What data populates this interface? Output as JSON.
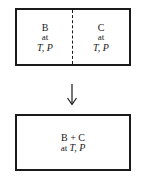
{
  "diagram": {
    "top_box": {
      "left_compartment": {
        "species": "B",
        "at": "at",
        "conditions": "T, P"
      },
      "right_compartment": {
        "species": "C",
        "at": "at",
        "conditions": "T, P"
      },
      "divider_style": "dashed"
    },
    "arrow": {
      "direction": "down",
      "icon": "down-arrow-icon"
    },
    "bottom_box": {
      "mixture": "B + C",
      "at": "at",
      "conditions": "T, P"
    },
    "colors": {
      "stroke": "#1a1a1a",
      "background": "#ffffff"
    }
  }
}
